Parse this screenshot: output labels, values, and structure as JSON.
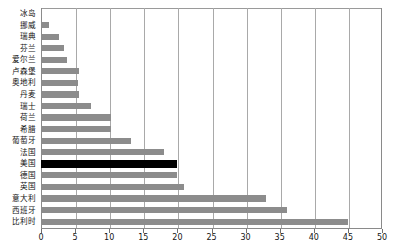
{
  "chart_data": {
    "type": "bar",
    "orientation": "horizontal",
    "title": "",
    "subtitle": "",
    "xlabel": "",
    "ylabel": "",
    "xlim": [
      0,
      50
    ],
    "xticks": [
      0,
      5,
      10,
      15,
      20,
      25,
      30,
      35,
      40,
      45,
      50
    ],
    "xticklabels": [
      "0",
      "5",
      "10",
      "15",
      "20",
      "25",
      "30",
      "35",
      "40",
      "45",
      "50"
    ],
    "grid": "vertical",
    "legend": "none",
    "categories": [
      "冰岛",
      "挪威",
      "瑞典",
      "芬兰",
      "爱尔兰",
      "卢森堡",
      "奥地利",
      "丹麦",
      "瑞士",
      "荷兰",
      "希腊",
      "葡萄牙",
      "法国",
      "美国",
      "德国",
      "英国",
      "意大利",
      "西班牙",
      "比利时"
    ],
    "values": [
      0.2,
      1.2,
      2.6,
      3.4,
      3.8,
      5.6,
      5.4,
      5.6,
      7.4,
      10.2,
      10.2,
      13.2,
      18.0,
      20.0,
      20.0,
      21.0,
      33.0,
      36.0,
      45.0
    ],
    "highlight_category": "美国",
    "colors": {
      "bar": "#8c8c8c",
      "highlight": "#000000",
      "grid": "#a9a9a9",
      "axis": "#8a8a8a",
      "background": "#ffffff",
      "text": "#141414"
    }
  }
}
